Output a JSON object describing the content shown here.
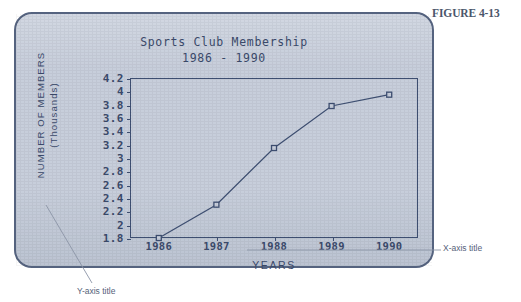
{
  "figure": {
    "caption": "FIGURE 4-13"
  },
  "annotations": {
    "x_axis_title_callout": "X-axis title",
    "y_axis_title_callout": "Y-axis title"
  },
  "colors": {
    "panel_background": "#c7cedb",
    "panel_border": "#55637f",
    "ink": "#3b4a6b",
    "plot_frame": "#3e4f72",
    "series_line": "#3e4f72",
    "marker_fill": "#c7cedb",
    "annotation_text": "#56627a",
    "page_background": "#ffffff"
  },
  "chart_data": {
    "type": "line",
    "title": "Sports Club Membership",
    "subtitle": "1986 - 1990",
    "xlabel": "YEARS",
    "ylabel": "NUMBER OF MEMBERS",
    "ylabel_line2": "(Thousands)",
    "categories": [
      "1986",
      "1987",
      "1988",
      "1989",
      "1990"
    ],
    "values": [
      1.8,
      2.3,
      3.15,
      3.78,
      3.95
    ],
    "ylim": [
      1.8,
      4.2
    ],
    "yticks": [
      1.8,
      2,
      2.2,
      2.4,
      2.6,
      2.8,
      3,
      3.2,
      3.4,
      3.6,
      3.8,
      4,
      4.2
    ],
    "ytick_labels": [
      "1.8",
      "2",
      "2.2",
      "2.4",
      "2.6",
      "2.8",
      "3",
      "3.2",
      "3.4",
      "3.6",
      "3.8",
      "4",
      "4.2"
    ],
    "grid": false,
    "legend": false,
    "marker": "open-square"
  }
}
